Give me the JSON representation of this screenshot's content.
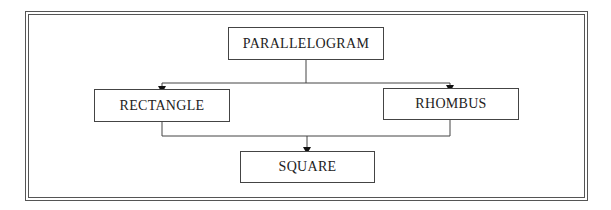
{
  "diagram": {
    "nodes": [
      {
        "id": "parallelogram",
        "label": "PARALLELOGRAM"
      },
      {
        "id": "rectangle",
        "label": "RECTANGLE"
      },
      {
        "id": "rhombus",
        "label": "RHOMBUS"
      },
      {
        "id": "square",
        "label": "SQUARE"
      }
    ],
    "edges": [
      {
        "from": "parallelogram",
        "to": "rectangle"
      },
      {
        "from": "parallelogram",
        "to": "rhombus"
      },
      {
        "from": "rectangle",
        "to": "square"
      },
      {
        "from": "rhombus",
        "to": "square"
      }
    ],
    "colors": {
      "line": "#444444",
      "frame": "#555555",
      "background": "#ffffff"
    }
  }
}
